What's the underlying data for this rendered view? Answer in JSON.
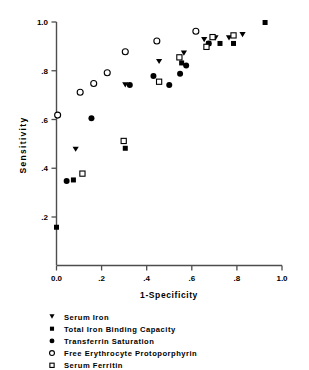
{
  "chart_data": {
    "type": "scatter",
    "title": "",
    "xlabel": "1-Specificity",
    "ylabel": "Sensitivity",
    "xlim": [
      0.0,
      1.0
    ],
    "ylim": [
      0.1,
      1.02
    ],
    "grid": false,
    "legend_position": "below-plot",
    "xticks": [
      "0.0",
      ".2",
      ".4",
      ".6",
      ".8",
      "1.0"
    ],
    "xtick_values": [
      0.0,
      0.2,
      0.4,
      0.6,
      0.8,
      1.0
    ],
    "yticks": [
      "1.0",
      ".8",
      ".6",
      ".4",
      ".2"
    ],
    "ytick_values": [
      1.0,
      0.8,
      0.6,
      0.4,
      0.2
    ],
    "series": [
      {
        "name": "Serum Iron",
        "marker": "filled-triangle-down",
        "color": "#000000",
        "points": [
          [
            0.085,
            0.478
          ],
          [
            0.305,
            0.742
          ],
          [
            0.455,
            0.838
          ],
          [
            0.565,
            0.872
          ],
          [
            0.655,
            0.928
          ],
          [
            0.705,
            0.935
          ],
          [
            0.765,
            0.935
          ],
          [
            0.825,
            0.948
          ]
        ]
      },
      {
        "name": "Total Iron Binding Capacity",
        "marker": "filled-square",
        "color": "#000000",
        "points": [
          [
            0.0,
            0.158
          ],
          [
            0.075,
            0.352
          ],
          [
            0.305,
            0.482
          ],
          [
            0.555,
            0.832
          ],
          [
            0.675,
            0.912
          ],
          [
            0.725,
            0.912
          ],
          [
            0.785,
            0.912
          ],
          [
            0.925,
            0.998
          ]
        ]
      },
      {
        "name": "Transferrin Saturation",
        "marker": "filled-circle",
        "color": "#000000",
        "points": [
          [
            0.045,
            0.348
          ],
          [
            0.155,
            0.605
          ],
          [
            0.325,
            0.742
          ],
          [
            0.43,
            0.778
          ],
          [
            0.5,
            0.742
          ],
          [
            0.548,
            0.788
          ],
          [
            0.575,
            0.822
          ],
          [
            0.675,
            0.912
          ]
        ]
      },
      {
        "name": "Free Erythrocyte Protoporphyrin",
        "marker": "open-circle",
        "color": "#000000",
        "points": [
          [
            0.005,
            0.618
          ],
          [
            0.105,
            0.712
          ],
          [
            0.165,
            0.748
          ],
          [
            0.225,
            0.792
          ],
          [
            0.305,
            0.878
          ],
          [
            0.445,
            0.922
          ],
          [
            0.618,
            0.962
          ]
        ]
      },
      {
        "name": "Serum Ferritin",
        "marker": "open-square",
        "color": "#000000",
        "points": [
          [
            0.115,
            0.378
          ],
          [
            0.298,
            0.512
          ],
          [
            0.455,
            0.755
          ],
          [
            0.545,
            0.855
          ],
          [
            0.665,
            0.898
          ],
          [
            0.692,
            0.938
          ],
          [
            0.785,
            0.945
          ]
        ]
      }
    ]
  },
  "legend": {
    "items": [
      {
        "label": "Serum Iron",
        "marker": "filled-triangle-down"
      },
      {
        "label": "Total Iron Binding Capacity",
        "marker": "filled-square"
      },
      {
        "label": "Transferrin Saturation",
        "marker": "filled-circle"
      },
      {
        "label": "Free Erythrocyte Protoporphyrin",
        "marker": "open-circle"
      },
      {
        "label": "Serum Ferritin",
        "marker": "open-square"
      }
    ]
  },
  "colors": {
    "axis": "#4d4d4d",
    "marker": "#000000",
    "background": "#ffffff"
  }
}
